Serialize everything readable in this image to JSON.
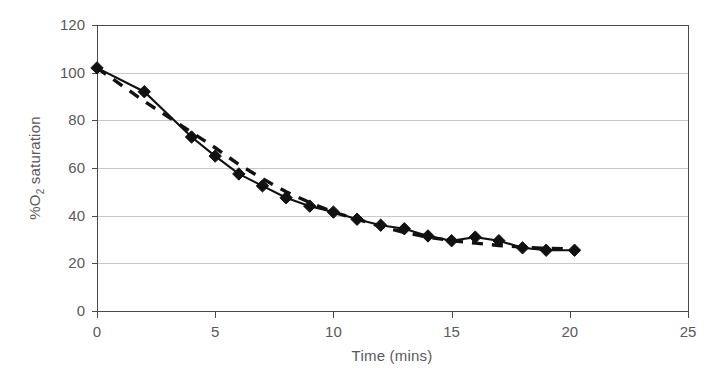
{
  "chart_data": {
    "type": "line",
    "title": "",
    "xlabel": "Time (mins)",
    "ylabel": "%O2 saturation",
    "ylabel_prefix": "%O",
    "ylabel_sub": "2",
    "ylabel_suffix": " saturation",
    "xlim": [
      0,
      25
    ],
    "ylim": [
      0,
      120
    ],
    "xticks": [
      0,
      5,
      10,
      15,
      20,
      25
    ],
    "xtick_labels": [
      "0",
      "5",
      "10",
      "15",
      "20",
      "25"
    ],
    "yticks": [
      0,
      20,
      40,
      60,
      80,
      100,
      120
    ],
    "ytick_labels": [
      "0",
      "20",
      "40",
      "60",
      "80",
      "100",
      "120"
    ],
    "grid": "horizontal",
    "legend": "none",
    "marker": "diamond",
    "marker_color": "#111111",
    "line_color": "#111111",
    "grid_color": "#c9c9c9",
    "axis_color": "#4a4a4a",
    "text_color": "#5a5a5a",
    "background": "#ffffff",
    "series": [
      {
        "name": "measured",
        "style": "solid-with-markers",
        "x": [
          0,
          2,
          4,
          5,
          6,
          7,
          8,
          9,
          10,
          11,
          12,
          13,
          14,
          15,
          16,
          17,
          18,
          19,
          20.2
        ],
        "y": [
          102,
          92,
          73,
          65,
          57.5,
          52.5,
          47.5,
          44,
          41.5,
          38.5,
          36,
          34.5,
          31.5,
          29.5,
          31,
          29.5,
          26.5,
          25.5,
          25.5
        ]
      },
      {
        "name": "fitted-trend",
        "style": "dashed",
        "x": [
          0,
          2,
          4,
          5,
          6,
          7,
          8,
          9,
          10,
          11,
          12,
          13,
          14,
          15,
          16,
          17,
          18,
          19,
          20.2
        ],
        "y": [
          102,
          88,
          75,
          68.5,
          61.5,
          55.5,
          50,
          45.5,
          41.5,
          38.5,
          35.5,
          33,
          31,
          29.5,
          28.5,
          27.5,
          26.8,
          26.3,
          26
        ]
      }
    ]
  },
  "axes": {
    "plot_left_px": 97,
    "plot_right_px": 688,
    "plot_top_px": 25,
    "plot_bottom_px": 311
  }
}
